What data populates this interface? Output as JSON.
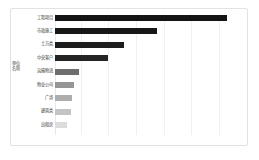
{
  "figure": {
    "background_color": "#ffffff",
    "border_color": "#e2e2e2"
  },
  "chart_data": {
    "type": "bar",
    "orientation": "horizontal",
    "title": "",
    "xlabel": "",
    "ylabel": "单位名称",
    "categories": [
      "工程项目",
      "市政施工",
      "土方类",
      "中央客户",
      "运输物流",
      "物业公司",
      "广场",
      "建筑类",
      "出租房"
    ],
    "values": [
      100,
      59,
      40,
      31,
      14,
      11,
      10,
      9,
      7
    ],
    "xlim": [
      0,
      108
    ],
    "grid": true,
    "gridline_values": [
      15,
      31,
      47,
      63,
      79,
      95
    ],
    "legend": "none",
    "bar_colors": [
      "#141414",
      "#171717",
      "#1c1c1c",
      "#242424",
      "#6e6e6e",
      "#969696",
      "#adadad",
      "#c4c4c4",
      "#dcdcdc"
    ]
  },
  "axis": {
    "y_title": "单位名称"
  }
}
